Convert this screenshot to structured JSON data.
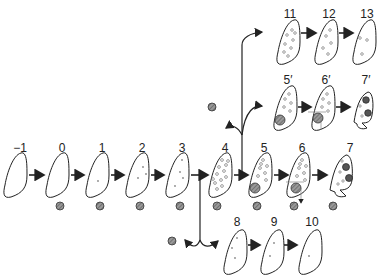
{
  "diagram": {
    "type": "stage-progression",
    "main_row": {
      "stages": [
        {
          "label": "−1",
          "x": 15,
          "dots": 0,
          "marker": false
        },
        {
          "label": "0",
          "x": 57,
          "dots": 0,
          "marker": true
        },
        {
          "label": "1",
          "x": 97,
          "dots": 1,
          "marker": true
        },
        {
          "label": "2",
          "x": 137,
          "dots": 3,
          "marker": true
        },
        {
          "label": "3",
          "x": 177,
          "dots": 4,
          "marker": true
        },
        {
          "label": "4",
          "x": 222,
          "dots": 12,
          "marker": true
        },
        {
          "label": "5",
          "x": 262,
          "dots": 10,
          "marker": true,
          "inclusion": true
        },
        {
          "label": "6",
          "x": 300,
          "dots": 10,
          "marker": true,
          "inclusion": true,
          "crosshair": true
        },
        {
          "label": "7",
          "x": 340,
          "dots": 6,
          "marker": true,
          "dark_spots": 2
        }
      ]
    },
    "upper_branch_1": {
      "stages": [
        {
          "label": "11",
          "x": 290,
          "dots": 12
        },
        {
          "label": "12",
          "x": 328,
          "dots": 8
        },
        {
          "label": "13",
          "x": 365,
          "dots": 4
        }
      ]
    },
    "upper_branch_2": {
      "stages": [
        {
          "label": "5′",
          "x": 285,
          "dots": 10,
          "inclusion": true
        },
        {
          "label": "6′",
          "x": 322,
          "dots": 10,
          "inclusion": true,
          "crosshair": true
        },
        {
          "label": "7′",
          "x": 362,
          "dots": 6,
          "dark_spots": 2
        }
      ]
    },
    "lower_branch": {
      "stages": [
        {
          "label": "8",
          "x": 235,
          "dots": 3
        },
        {
          "label": "9",
          "x": 272,
          "dots": 2
        },
        {
          "label": "10",
          "x": 310,
          "dots": 1
        }
      ]
    },
    "colors": {
      "stroke": "#222222",
      "marker_fill": "#888888"
    }
  }
}
